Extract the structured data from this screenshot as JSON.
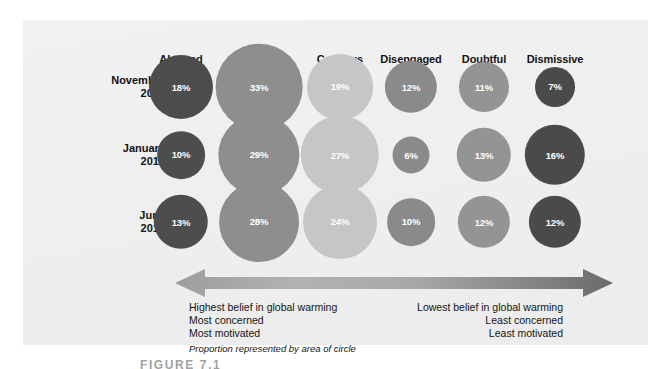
{
  "figure": {
    "caption": "FIGURE    7.1",
    "panel_background": "#efefef"
  },
  "chart_data": {
    "type": "bubble",
    "title": "",
    "subtitle": "",
    "xlabel": "",
    "ylabel": "",
    "note": "Proportion represented by area of circle",
    "categories": [
      "Alarmed",
      "Concerned",
      "Cautious",
      "Disengaged",
      "Doubtful",
      "Dismissive"
    ],
    "category_colors": [
      "#4d4d4d",
      "#8e8e8e",
      "#c3c3c3",
      "#8a8a8a",
      "#929292",
      "#4a4a4a"
    ],
    "rows": [
      "November 2008",
      "January 2010",
      "June 2010"
    ],
    "series": [
      {
        "name": "November 2008",
        "values": [
          18,
          33,
          19,
          12,
          11,
          7
        ]
      },
      {
        "name": "January 2010",
        "values": [
          10,
          29,
          27,
          6,
          13,
          16
        ]
      },
      {
        "name": "June 2010",
        "values": [
          13,
          28,
          24,
          10,
          12,
          12
        ]
      }
    ],
    "value_suffix": "%",
    "legend_position": "none",
    "grid": false
  },
  "columns": [
    {
      "label": "Alarmed",
      "x": 181,
      "color": "#4d4d4d"
    },
    {
      "label": "Concerned",
      "x": 259,
      "color": "#8e8e8e"
    },
    {
      "label": "Cautious",
      "x": 340,
      "color": "#c6c6c6"
    },
    {
      "label": "Disengaged",
      "x": 411,
      "color": "#8a8a8a"
    },
    {
      "label": "Doubtful",
      "x": 484,
      "color": "#949494"
    },
    {
      "label": "Dismissive",
      "x": 555,
      "color": "#4a4a4a"
    }
  ],
  "rows": [
    {
      "label_line1": "November",
      "label_line2": "2008",
      "y": 87,
      "cells": [
        {
          "value": "18%",
          "pct": 18
        },
        {
          "value": "33%",
          "pct": 33
        },
        {
          "value": "19%",
          "pct": 19
        },
        {
          "value": "12%",
          "pct": 12
        },
        {
          "value": "11%",
          "pct": 11
        },
        {
          "value": "7%",
          "pct": 7
        }
      ]
    },
    {
      "label_line1": "January",
      "label_line2": "2010",
      "y": 155,
      "cells": [
        {
          "value": "10%",
          "pct": 10
        },
        {
          "value": "29%",
          "pct": 29
        },
        {
          "value": "27%",
          "pct": 27
        },
        {
          "value": "6%",
          "pct": 6
        },
        {
          "value": "13%",
          "pct": 13
        },
        {
          "value": "16%",
          "pct": 16
        }
      ]
    },
    {
      "label_line1": "June",
      "label_line2": "2010",
      "y": 222,
      "cells": [
        {
          "value": "13%",
          "pct": 13
        },
        {
          "value": "28%",
          "pct": 28
        },
        {
          "value": "24%",
          "pct": 24
        },
        {
          "value": "10%",
          "pct": 10
        },
        {
          "value": "12%",
          "pct": 12
        },
        {
          "value": "12%",
          "pct": 12
        }
      ]
    }
  ],
  "annotations": {
    "left": {
      "line1": "Highest belief in global warming",
      "line2": "Most concerned",
      "line3": "Most motivated",
      "note": "Proportion represented by area of circle"
    },
    "right": {
      "line1": "Lowest belief in global warming",
      "line2": "Least concerned",
      "line3": "Least motivated"
    }
  },
  "arrow": {
    "name": "double-headed-spectrum-arrow",
    "color_left": "#9b9b9b",
    "color_mid": "#b4b4b4",
    "color_right": "#6f6f6f"
  }
}
